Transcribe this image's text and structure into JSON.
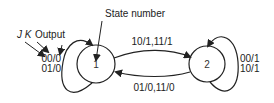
{
  "diagram": {
    "type": "state-diagram",
    "annotations": {
      "state_number": "State number",
      "jk_prefix": "J K",
      "output": "Output"
    },
    "states": [
      {
        "id": "1",
        "label": "1"
      },
      {
        "id": "2",
        "label": "2"
      }
    ],
    "transitions": [
      {
        "from": "1",
        "to": "1",
        "labels": [
          "00/0",
          "01/0"
        ],
        "line1": "00/0",
        "line2": "01/0"
      },
      {
        "from": "1",
        "to": "2",
        "label": "10/1,11/1"
      },
      {
        "from": "2",
        "to": "1",
        "label": "01/0,11/0"
      },
      {
        "from": "2",
        "to": "2",
        "labels": [
          "00/1",
          "10/1"
        ],
        "line1": "00/1",
        "line2": "10/1"
      }
    ],
    "colors": {
      "stroke": "#222222",
      "background": "#ffffff"
    }
  }
}
